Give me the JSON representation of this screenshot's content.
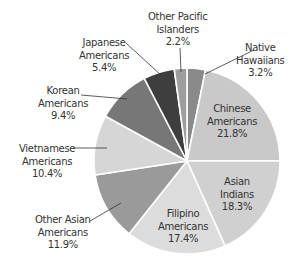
{
  "chart_data": {
    "type": "pie",
    "title": "",
    "start_angle": "12 o'clock",
    "direction": "clockwise",
    "slices": [
      {
        "label": "Native Hawaiians",
        "value": 3.2,
        "value_label": "3.2%",
        "color": "#8a8a8a"
      },
      {
        "label": "Chinese Americans",
        "value": 21.8,
        "value_label": "21.8%",
        "color": "#c9c9c9"
      },
      {
        "label": "Asian Indians",
        "value": 18.3,
        "value_label": "18.3%",
        "color": "#d0d0d0"
      },
      {
        "label": "Filipino Americans",
        "value": 17.4,
        "value_label": "17.4%",
        "color": "#dcdcdc"
      },
      {
        "label": "Other Asian Americans",
        "value": 11.9,
        "value_label": "11.9%",
        "color": "#9a9a9a"
      },
      {
        "label": "Vietnamese Americans",
        "value": 10.4,
        "value_label": "10.4%",
        "color": "#d6d6d6"
      },
      {
        "label": "Korean Americans",
        "value": 9.4,
        "value_label": "9.4%",
        "color": "#777777"
      },
      {
        "label": "Japanese Americans",
        "value": 5.4,
        "value_label": "5.4%",
        "color": "#3e3e3e"
      },
      {
        "label": "Other Pacific Islanders",
        "value": 2.2,
        "value_label": "2.2%",
        "color": "#9e9e9e"
      }
    ]
  },
  "labels": {
    "native_hawaiians": {
      "line1": "Native",
      "line2": "Hawaiians",
      "pct": "3.2%"
    },
    "chinese": {
      "line1": "Chinese",
      "line2": "Americans",
      "pct": "21.8%"
    },
    "asian_indians": {
      "line1": "Asian",
      "line2": "Indians",
      "pct": "18.3%"
    },
    "filipino": {
      "line1": "Filipino",
      "line2": "Americans",
      "pct": "17.4%"
    },
    "other_asian": {
      "line1": "Other Asian",
      "line2": "Americans",
      "pct": "11.9%"
    },
    "vietnamese": {
      "line1": "Vietnamese",
      "line2": "Americans",
      "pct": "10.4%"
    },
    "korean": {
      "line1": "Korean",
      "line2": "Americans",
      "pct": "9.4%"
    },
    "japanese": {
      "line1": "Japanese",
      "line2": "Americans",
      "pct": "5.4%"
    },
    "other_pacific": {
      "line1": "Other Pacific",
      "line2": "Islanders",
      "pct": "2.2%"
    }
  }
}
